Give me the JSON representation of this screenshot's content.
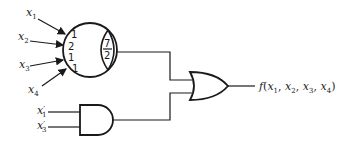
{
  "diagram": {
    "type": "logic-circuit",
    "threshold_gate": {
      "inputs": [
        {
          "var": "x",
          "sub": "1",
          "weight": "1"
        },
        {
          "var": "x",
          "sub": "2",
          "weight": "2"
        },
        {
          "var": "x",
          "sub": "3",
          "weight": "1"
        },
        {
          "var": "x",
          "sub": "4",
          "weight": "1"
        }
      ],
      "threshold_num": "7",
      "threshold_den": "2"
    },
    "and_gate": {
      "inputs": [
        {
          "var": "x",
          "sub": "1",
          "prime": "′"
        },
        {
          "var": "x",
          "sub": "3",
          "prime": "′"
        }
      ]
    },
    "or_gate": {},
    "output": {
      "func": "f",
      "open": "(",
      "args": [
        {
          "var": "x",
          "sub": "1"
        },
        {
          "var": "x",
          "sub": "2"
        },
        {
          "var": "x",
          "sub": "3"
        },
        {
          "var": "x",
          "sub": "4"
        }
      ],
      "sep": ", ",
      "close": ")"
    },
    "colors": {
      "ink": "#1a1a1a",
      "background": "#ffffff"
    }
  }
}
